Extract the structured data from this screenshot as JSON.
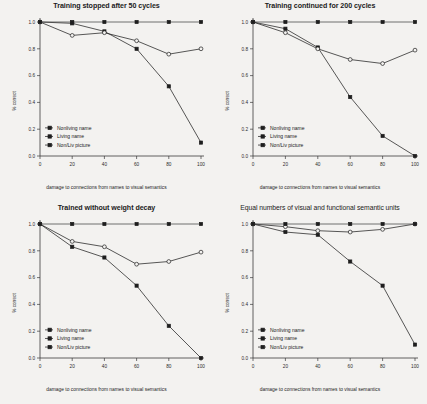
{
  "figure": {
    "axis": {
      "ylabel": "% correct",
      "xlabel": "damage to connections from names to visual semantics",
      "xticks": [
        "0",
        "20",
        "40",
        "60",
        "80",
        "100"
      ],
      "yticks": [
        "0.0",
        "0.2",
        "0.4",
        "0.6",
        "0.8",
        "1.0"
      ]
    },
    "legend": {
      "nonliving_name": "Nonliving name",
      "living_name": "Living name",
      "picture": "Non/Liv picture"
    }
  },
  "chart_data": [
    {
      "type": "line",
      "title": "Training stopped after 50 cycles",
      "xlabel": "damage to connections from names to visual semantics",
      "ylabel": "% correct",
      "x": [
        0,
        20,
        40,
        60,
        80,
        100
      ],
      "xlim": [
        0,
        100
      ],
      "ylim": [
        0.0,
        1.0
      ],
      "grid": false,
      "legend_position": "lower-left",
      "series": [
        {
          "name": "Nonliving name",
          "values": [
            1.0,
            0.99,
            0.93,
            0.8,
            0.52,
            0.1
          ],
          "marker": "filled-square"
        },
        {
          "name": "Living name",
          "values": [
            1.0,
            0.9,
            0.92,
            0.86,
            0.76,
            0.8
          ],
          "marker": "open-circle"
        },
        {
          "name": "Non/Liv picture",
          "values": [
            1.0,
            1.0,
            1.0,
            1.0,
            1.0,
            1.0
          ],
          "marker": "filled-square"
        }
      ]
    },
    {
      "type": "line",
      "title": "Training continued for 200 cycles",
      "xlabel": "damage to connections from names to visual semantics",
      "ylabel": "% correct",
      "x": [
        0,
        20,
        40,
        60,
        80,
        100
      ],
      "xlim": [
        0,
        100
      ],
      "ylim": [
        0.0,
        1.0
      ],
      "grid": false,
      "legend_position": "lower-left",
      "series": [
        {
          "name": "Nonliving name",
          "values": [
            1.0,
            0.95,
            0.81,
            0.44,
            0.15,
            0.0
          ],
          "marker": "filled-square"
        },
        {
          "name": "Living name",
          "values": [
            1.0,
            0.92,
            0.8,
            0.72,
            0.69,
            0.79
          ],
          "marker": "open-circle"
        },
        {
          "name": "Non/Liv picture",
          "values": [
            1.0,
            1.0,
            1.0,
            1.0,
            1.0,
            1.0
          ],
          "marker": "filled-square"
        }
      ]
    },
    {
      "type": "line",
      "title": "Trained without weight decay",
      "xlabel": "damage to connections from names to visual semantics",
      "ylabel": "% correct",
      "x": [
        0,
        20,
        40,
        60,
        80,
        100
      ],
      "xlim": [
        0,
        100
      ],
      "ylim": [
        0.0,
        1.0
      ],
      "grid": false,
      "legend_position": "lower-left",
      "series": [
        {
          "name": "Nonliving name",
          "values": [
            1.0,
            0.83,
            0.75,
            0.54,
            0.24,
            0.0
          ],
          "marker": "filled-square"
        },
        {
          "name": "Living name",
          "values": [
            1.0,
            0.87,
            0.83,
            0.7,
            0.72,
            0.79
          ],
          "marker": "open-circle"
        },
        {
          "name": "Non/Liv picture",
          "values": [
            1.0,
            1.0,
            1.0,
            1.0,
            1.0,
            1.0
          ],
          "marker": "filled-square"
        }
      ]
    },
    {
      "type": "line",
      "title": "Equal numbers of visual and functional semantic units",
      "xlabel": "damage to connections from names to visual semantics",
      "ylabel": "% correct",
      "x": [
        0,
        20,
        40,
        60,
        80,
        100
      ],
      "xlim": [
        0,
        100
      ],
      "ylim": [
        0.0,
        1.0
      ],
      "grid": false,
      "legend_position": "lower-left",
      "series": [
        {
          "name": "Nonliving name",
          "values": [
            1.0,
            0.94,
            0.92,
            0.72,
            0.54,
            0.1
          ],
          "marker": "filled-square"
        },
        {
          "name": "Living name",
          "values": [
            1.0,
            0.98,
            0.95,
            0.94,
            0.96,
            1.0
          ],
          "marker": "open-circle"
        },
        {
          "name": "Non/Liv picture",
          "values": [
            1.0,
            1.0,
            1.0,
            1.0,
            1.0,
            1.0
          ],
          "marker": "filled-square"
        }
      ]
    }
  ]
}
